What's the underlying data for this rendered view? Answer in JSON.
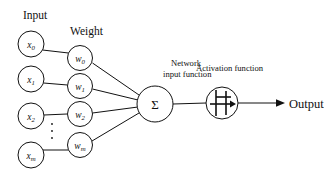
{
  "diagram": {
    "headings": {
      "input": "Input",
      "weight": "Weight"
    },
    "captions": {
      "network_input_function_line1": "Network",
      "network_input_function_line2": "input function",
      "activation_function": "Activation function",
      "output": "Output"
    },
    "input_nodes": [
      {
        "base": "x",
        "sub": "0",
        "cx": 31,
        "cy": 44
      },
      {
        "base": "x",
        "sub": "1",
        "cx": 31,
        "cy": 79
      },
      {
        "base": "x",
        "sub": "2",
        "cx": 31,
        "cy": 116
      },
      {
        "base": "x",
        "sub": "m",
        "cx": 31,
        "cy": 155
      }
    ],
    "weight_nodes": [
      {
        "base": "w",
        "sub": "0",
        "cx": 80,
        "cy": 58
      },
      {
        "base": "w",
        "sub": "1",
        "cx": 80,
        "cy": 86
      },
      {
        "base": "w",
        "sub": "2",
        "cx": 80,
        "cy": 114
      },
      {
        "base": "w",
        "sub": "m",
        "cx": 80,
        "cy": 145
      }
    ],
    "summation_node": {
      "symbol": "Σ",
      "cx": 155,
      "cy": 104,
      "r": 18
    },
    "activation_node": {
      "cx": 222,
      "cy": 103,
      "r": 16,
      "glyph": "step-function"
    },
    "node_radius": 13,
    "colors": {
      "stroke": "#111111",
      "background": "#ffffff",
      "text": "#111111"
    }
  }
}
